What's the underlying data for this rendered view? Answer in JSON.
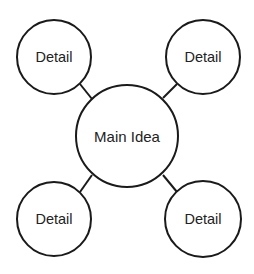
{
  "diagram": {
    "type": "mind-map",
    "stroke_color": "#1a1a1a",
    "text_color": "#222222",
    "background": "#ffffff",
    "center": {
      "label": "Main Idea",
      "cx": 127,
      "cy": 136,
      "r": 51
    },
    "details": [
      {
        "label": "Detail",
        "position": "top-left",
        "cx": 54,
        "cy": 57,
        "r": 37
      },
      {
        "label": "Detail",
        "position": "top-right",
        "cx": 203,
        "cy": 57,
        "r": 37
      },
      {
        "label": "Detail",
        "position": "bottom-left",
        "cx": 54,
        "cy": 219,
        "r": 37
      },
      {
        "label": "Detail",
        "position": "bottom-right",
        "cx": 203,
        "cy": 219,
        "r": 38
      }
    ]
  }
}
